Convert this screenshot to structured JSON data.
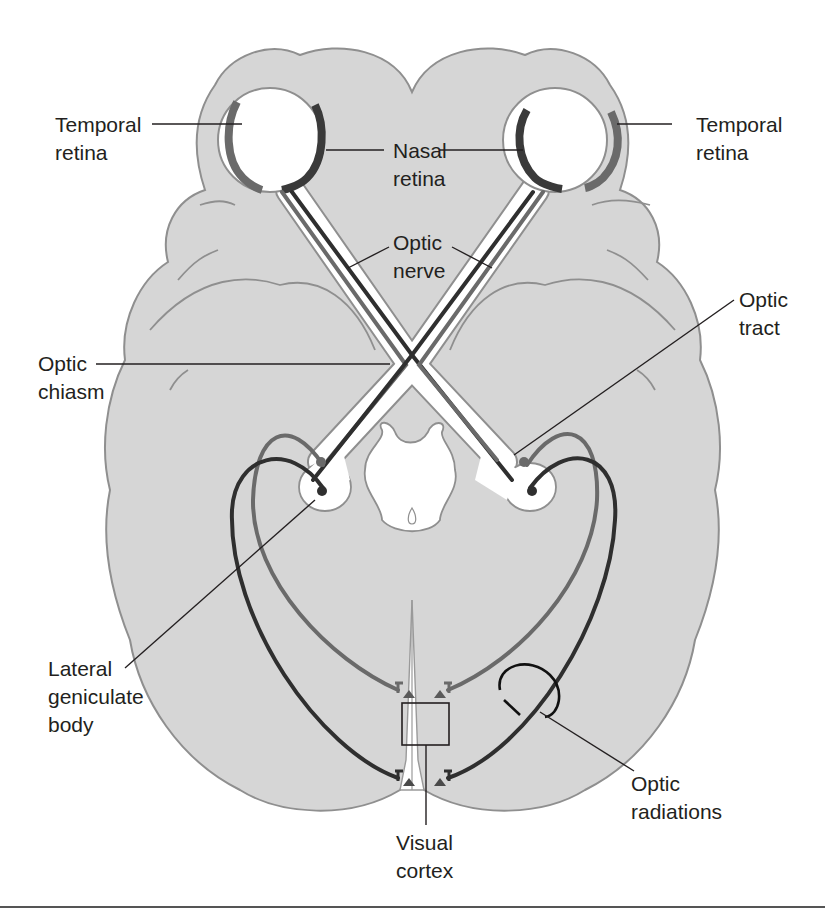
{
  "figure": {
    "colors": {
      "brain_fill": "#d6d6d6",
      "brain_outline": "#8f8f8f",
      "nasal_fiber": "#2f2f2f",
      "temporal_fiber": "#6a6a6a",
      "label_text": "#231f20",
      "background": "#ffffff"
    }
  },
  "labels": {
    "temporal_retina_left": {
      "line1": "Temporal",
      "line2": "retina"
    },
    "temporal_retina_right": {
      "line1": "Temporal",
      "line2": "retina"
    },
    "nasal_retina": {
      "line1": "Nasal",
      "line2": "retina"
    },
    "optic_nerve": {
      "line1": "Optic",
      "line2": "nerve"
    },
    "optic_chiasm": {
      "line1": "Optic",
      "line2": "chiasm"
    },
    "optic_tract": {
      "line1": "Optic",
      "line2": "tract"
    },
    "lateral_geniculate_body": {
      "line1": "Lateral",
      "line2": "geniculate",
      "line3": "body"
    },
    "optic_radiations": {
      "line1": "Optic",
      "line2": "radiations"
    },
    "visual_cortex": {
      "line1": "Visual",
      "line2": "cortex"
    }
  }
}
